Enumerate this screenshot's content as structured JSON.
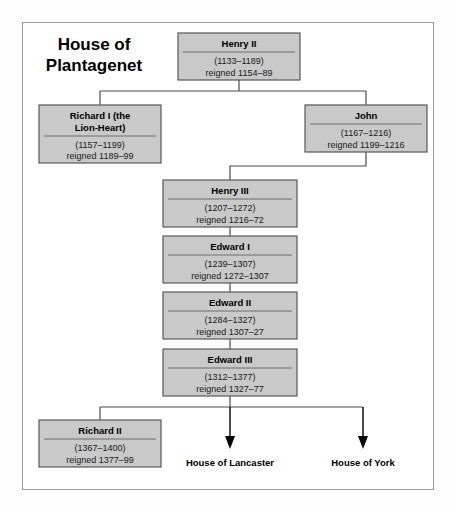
{
  "diagram": {
    "title_line1": "House of",
    "title_line2": "Plantagenet",
    "colors": {
      "box_fill": "#c9c9c9",
      "box_border": "#585858",
      "frame_border": "#9a9a9a",
      "connector": "#4a4a4a",
      "text": "#000000",
      "background": "#ffffff"
    },
    "nodes": [
      {
        "id": "henry-ii",
        "name": "Henry II",
        "life": "(1133–1189)",
        "reign": "reigned 1154–89",
        "x": 178,
        "y": 33,
        "w": 122,
        "h": 47
      },
      {
        "id": "richard-i",
        "name_line1": "Richard I (the",
        "name_line2": "Lion-Heart)",
        "name": "Richard I (the Lion-Heart)",
        "life": "(1157–1199)",
        "reign": "reigned 1189–99",
        "x": 39,
        "y": 105,
        "w": 122,
        "h": 58
      },
      {
        "id": "john",
        "name": "John",
        "life": "(1167–1216)",
        "reign": "reigned 1199–1216",
        "x": 305,
        "y": 105,
        "w": 122,
        "h": 47
      },
      {
        "id": "henry-iii",
        "name": "Henry III",
        "life": "(1207–1272)",
        "reign": "reigned 1216–72",
        "x": 163,
        "y": 180,
        "w": 134,
        "h": 47
      },
      {
        "id": "edward-i",
        "name": "Edward I",
        "life": "(1239–1307)",
        "reign": "reigned 1272–1307",
        "x": 163,
        "y": 236,
        "w": 134,
        "h": 47
      },
      {
        "id": "edward-ii",
        "name": "Edward II",
        "life": "(1284–1327)",
        "reign": "reigned 1307–27",
        "x": 163,
        "y": 292,
        "w": 134,
        "h": 47
      },
      {
        "id": "edward-iii",
        "name": "Edward III",
        "life": "(1312–1377)",
        "reign": "reigned 1327–77",
        "x": 163,
        "y": 349,
        "w": 134,
        "h": 47
      },
      {
        "id": "richard-ii",
        "name": "Richard II",
        "life": "(1367–1400)",
        "reign": "reigned 1377–99",
        "x": 39,
        "y": 420,
        "w": 122,
        "h": 47
      }
    ],
    "house_labels": [
      {
        "id": "house-of-lancaster",
        "label": "House of Lancaster",
        "x": 230,
        "y": 462
      },
      {
        "id": "house-of-york",
        "label": "House of York",
        "x": 363,
        "y": 462
      }
    ]
  }
}
